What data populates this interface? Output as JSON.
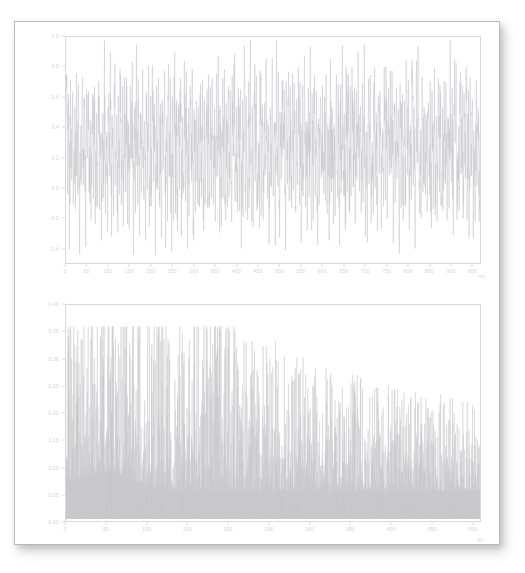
{
  "document": {
    "title": "Signal analysis figure sheet",
    "background_color": "#ffffff",
    "paper_color": "#ffffff",
    "border_color": "#b9b9bd",
    "trace_color": "#c6c6cb",
    "axis_color": "#d9d9dd",
    "tick_label_color": "#d2d2d6"
  },
  "chart_data": [
    {
      "id": "time-domain",
      "type": "line",
      "title": "",
      "xlabel": "ms",
      "ylabel": "",
      "xlim": [
        0,
        970
      ],
      "ylim": [
        -0.5,
        1.0
      ],
      "grid": false,
      "legend": "none",
      "xticks": [
        0,
        50,
        100,
        150,
        200,
        250,
        300,
        350,
        400,
        450,
        500,
        550,
        600,
        650,
        700,
        750,
        800,
        850,
        900,
        950
      ],
      "xtick_labels": [
        "0",
        "50",
        "100",
        "150",
        "200",
        "250",
        "300",
        "350",
        "400",
        "450",
        "500",
        "550",
        "600",
        "650",
        "700",
        "750",
        "800",
        "850",
        "900",
        "950"
      ],
      "yticks": [
        1.0,
        0.8,
        0.6,
        0.4,
        0.2,
        0.0,
        -0.2,
        -0.4
      ],
      "ytick_labels": [
        "1.0",
        "0.8",
        "0.6",
        "0.4",
        "0.2",
        "0.0",
        "-0.2",
        "-0.4"
      ],
      "series": [
        {
          "name": "amplitude",
          "color": "#c6c6cb",
          "description": "dense noisy oscillating waveform spanning the full vertical range",
          "x": [
            0,
            970
          ],
          "values": [
            0.0,
            0.0
          ]
        }
      ]
    },
    {
      "id": "frequency-domain",
      "type": "line",
      "title": "",
      "xlabel": "Hz",
      "ylabel": "",
      "xlim": [
        0,
        510
      ],
      "ylim": [
        0.0,
        0.4
      ],
      "grid": false,
      "legend": "none",
      "xticks": [
        0,
        50,
        100,
        150,
        200,
        250,
        300,
        350,
        400,
        450,
        500
      ],
      "xtick_labels": [
        "0",
        "50",
        "100",
        "150",
        "200",
        "250",
        "300",
        "350",
        "400",
        "450",
        "500"
      ],
      "yticks": [
        0.4,
        0.35,
        0.3,
        0.25,
        0.2,
        0.15,
        0.1,
        0.05,
        0.0
      ],
      "ytick_labels": [
        "0.40",
        "0.35",
        "0.30",
        "0.25",
        "0.20",
        "0.15",
        "0.10",
        "0.05",
        "0.00"
      ],
      "series": [
        {
          "name": "magnitude",
          "color": "#c9c9ce",
          "description": "spiky spectrum with peaks clustered below 0.30 and a maximum near 0.33",
          "x": [
            0,
            510
          ],
          "values": [
            0.0,
            0.0
          ]
        }
      ]
    }
  ]
}
